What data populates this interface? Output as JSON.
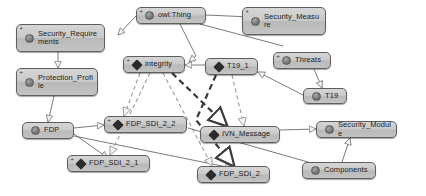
{
  "diagram": {
    "type": "uml-class-hierarchy",
    "background_color": "#ffffff",
    "node_fill_color": "#c4c4c4",
    "node_border_color": "#5e5e5e",
    "edge_color_solid": "#6b6b6b",
    "edge_color_dashed": "#9a9a9a",
    "edge_color_bold": "#3a3a3a"
  },
  "nodes": [
    {
      "id": "owl_thing",
      "label": "owl:Thing",
      "icon": "class-circle-icon",
      "icon_kind": "circle",
      "expander": "+",
      "x": 136,
      "y": 7,
      "w": 70,
      "h": 17
    },
    {
      "id": "security_requirements",
      "label": "Security_Requirements",
      "icon": "class-circle-icon",
      "icon_kind": "circle",
      "expander": "+",
      "x": 16,
      "y": 24,
      "w": 89,
      "h": 28
    },
    {
      "id": "security_measure",
      "label": "Security_Measure",
      "icon": "class-circle-icon",
      "icon_kind": "circle",
      "expander": "+",
      "x": 242,
      "y": 7,
      "w": 84,
      "h": 28
    },
    {
      "id": "protection_profile",
      "label": "Protection_Profile",
      "icon": "class-circle-icon",
      "icon_kind": "circle",
      "expander": "+",
      "x": 16,
      "y": 68,
      "w": 82,
      "h": 28
    },
    {
      "id": "integrity",
      "label": "integrity",
      "icon": "individual-diamond-icon",
      "icon_kind": "diamond",
      "expander": "+",
      "x": 123,
      "y": 56,
      "w": 62,
      "h": 17
    },
    {
      "id": "t19_1",
      "label": "T19_1",
      "icon": "individual-diamond-icon",
      "icon_kind": "diamond",
      "expander": "",
      "x": 205,
      "y": 58,
      "w": 53,
      "h": 17
    },
    {
      "id": "threats",
      "label": "Threats",
      "icon": "class-circle-icon",
      "icon_kind": "circle",
      "expander": "+",
      "x": 273,
      "y": 52,
      "w": 58,
      "h": 17
    },
    {
      "id": "t19",
      "label": "T19",
      "icon": "class-circle-icon",
      "icon_kind": "circle",
      "expander": "",
      "x": 303,
      "y": 88,
      "w": 44,
      "h": 16
    },
    {
      "id": "fdp",
      "label": "FDP",
      "icon": "class-circle-icon",
      "icon_kind": "circle",
      "expander": "",
      "x": 22,
      "y": 122,
      "w": 52,
      "h": 17
    },
    {
      "id": "fdp_sdi_2_2",
      "label": "FDP_SDI_2_2",
      "icon": "individual-diamond-icon",
      "icon_kind": "diamond",
      "expander": "+",
      "x": 104,
      "y": 116,
      "w": 83,
      "h": 17
    },
    {
      "id": "fdp_sdi_2_1",
      "label": "FDP_SDI_2_1",
      "icon": "individual-diamond-icon",
      "icon_kind": "diamond",
      "expander": "+",
      "x": 67,
      "y": 155,
      "w": 83,
      "h": 17
    },
    {
      "id": "fdp_sdi_2",
      "label": "FDP_SDI_2",
      "icon": "individual-diamond-icon",
      "icon_kind": "diamond",
      "expander": "",
      "x": 197,
      "y": 166,
      "w": 73,
      "h": 17
    },
    {
      "id": "ivn_message",
      "label": "IVN_Message",
      "icon": "individual-diamond-icon",
      "icon_kind": "diamond",
      "expander": "",
      "x": 200,
      "y": 126,
      "w": 80,
      "h": 17
    },
    {
      "id": "security_module",
      "label": "Security_Module",
      "icon": "class-circle-icon",
      "icon_kind": "circle",
      "expander": "",
      "x": 316,
      "y": 121,
      "w": 81,
      "h": 17
    },
    {
      "id": "components",
      "label": "Components",
      "icon": "class-circle-icon",
      "icon_kind": "circle",
      "expander": "",
      "x": 302,
      "y": 162,
      "w": 74,
      "h": 17
    }
  ],
  "edges": [
    {
      "from": "owl_thing",
      "to": "security_requirements",
      "style": "solid",
      "arrow": "hollow-triangle"
    },
    {
      "from": "owl_thing",
      "to": "security_measure",
      "style": "solid",
      "arrow": "hollow-triangle"
    },
    {
      "from": "owl_thing",
      "to": "integrity",
      "style": "solid",
      "arrow": "hollow-triangle"
    },
    {
      "from": "owl_thing",
      "to": "threats",
      "style": "solid",
      "arrow": "hollow-triangle"
    },
    {
      "from": "security_requirements",
      "to": "protection_profile",
      "style": "solid",
      "arrow": "hollow-triangle"
    },
    {
      "from": "protection_profile",
      "to": "fdp",
      "style": "solid",
      "arrow": "hollow-triangle"
    },
    {
      "from": "fdp",
      "to": "fdp_sdi_2_2",
      "style": "solid",
      "arrow": "hollow-triangle"
    },
    {
      "from": "fdp",
      "to": "fdp_sdi_2_1",
      "style": "solid",
      "arrow": "hollow-triangle"
    },
    {
      "from": "fdp",
      "to": "fdp_sdi_2",
      "style": "solid",
      "arrow": "hollow-triangle"
    },
    {
      "from": "integrity",
      "to": "fdp_sdi_2_2",
      "style": "dashed",
      "arrow": "hollow-triangle"
    },
    {
      "from": "integrity",
      "to": "fdp_sdi_2_1",
      "style": "dashed",
      "arrow": "hollow-triangle"
    },
    {
      "from": "integrity",
      "to": "fdp_sdi_2",
      "style": "dashed",
      "arrow": "hollow-triangle"
    },
    {
      "from": "integrity",
      "to": "ivn_message",
      "style": "bold-dashed",
      "arrow": "hollow-triangle"
    },
    {
      "from": "t19_1",
      "to": "integrity",
      "style": "solid",
      "arrow": "hollow-triangle"
    },
    {
      "from": "t19_1",
      "to": "ivn_message",
      "style": "dashed",
      "arrow": "hollow-triangle"
    },
    {
      "from": "t19_1",
      "to": "fdp_sdi_2",
      "style": "bold-dashed",
      "arrow": "hollow-triangle"
    },
    {
      "from": "threats",
      "to": "t19",
      "style": "solid",
      "arrow": "hollow-triangle"
    },
    {
      "from": "t19",
      "to": "t19_1",
      "style": "solid",
      "arrow": "hollow-triangle"
    },
    {
      "from": "ivn_message",
      "to": "security_module",
      "style": "solid",
      "arrow": "hollow-triangle"
    },
    {
      "from": "components",
      "to": "security_module",
      "style": "solid",
      "arrow": "hollow-triangle"
    },
    {
      "from": "components",
      "to": "fdp_sdi_2_2",
      "style": "solid",
      "arrow": "none"
    }
  ]
}
